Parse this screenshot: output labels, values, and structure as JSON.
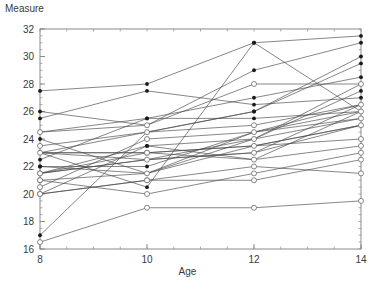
{
  "chart_data": {
    "type": "line",
    "title": "",
    "xlabel": "Age",
    "ylabel": "Measure",
    "xlim": [
      8,
      14
    ],
    "ylim": [
      16,
      32
    ],
    "x": [
      8,
      10,
      12,
      14
    ],
    "xticks": [
      8,
      10,
      12,
      14
    ],
    "xtick_labels": [
      "8",
      "10",
      "12",
      "14"
    ],
    "yticks": [
      16,
      18,
      20,
      22,
      24,
      26,
      28,
      30,
      32
    ],
    "ytick_labels": [
      "16",
      "18",
      "20",
      "22",
      "24",
      "26",
      "28",
      "30",
      "32"
    ],
    "x_minor_step": 0.5,
    "y_minor_step": 0.5,
    "grid": false,
    "legend": "none",
    "marker_styles": {
      "filled": "solid black dot",
      "open": "open circle"
    },
    "series": [
      {
        "name": "M01",
        "marker": "filled",
        "values": [
          26.0,
          25.0,
          29.0,
          31.0
        ]
      },
      {
        "name": "M02",
        "marker": "filled",
        "values": [
          21.5,
          22.5,
          23.0,
          26.5
        ]
      },
      {
        "name": "M03",
        "marker": "filled",
        "values": [
          23.0,
          22.5,
          24.0,
          27.5
        ]
      },
      {
        "name": "M04",
        "marker": "filled",
        "values": [
          25.5,
          27.5,
          26.5,
          27.0
        ]
      },
      {
        "name": "M05",
        "marker": "filled",
        "values": [
          20.0,
          23.5,
          22.5,
          26.0
        ]
      },
      {
        "name": "M06",
        "marker": "filled",
        "values": [
          24.5,
          25.5,
          27.0,
          28.5
        ]
      },
      {
        "name": "M07",
        "marker": "filled",
        "values": [
          22.0,
          22.0,
          24.5,
          26.5
        ]
      },
      {
        "name": "M08",
        "marker": "filled",
        "values": [
          24.0,
          21.5,
          24.5,
          25.5
        ]
      },
      {
        "name": "M09",
        "marker": "filled",
        "values": [
          23.0,
          20.5,
          31.0,
          26.0
        ]
      },
      {
        "name": "M10",
        "marker": "filled",
        "values": [
          27.5,
          28.0,
          31.0,
          31.5
        ]
      },
      {
        "name": "M11",
        "marker": "filled",
        "values": [
          23.0,
          23.0,
          23.5,
          25.0
        ]
      },
      {
        "name": "M12",
        "marker": "filled",
        "values": [
          21.5,
          23.5,
          24.0,
          28.0
        ]
      },
      {
        "name": "M13",
        "marker": "filled",
        "values": [
          17.0,
          24.5,
          26.0,
          29.5
        ]
      },
      {
        "name": "M14",
        "marker": "filled",
        "values": [
          22.5,
          25.5,
          25.5,
          26.0
        ]
      },
      {
        "name": "M15",
        "marker": "filled",
        "values": [
          23.0,
          24.5,
          26.0,
          30.0
        ]
      },
      {
        "name": "M16",
        "marker": "filled",
        "values": [
          22.0,
          21.5,
          23.5,
          25.0
        ]
      },
      {
        "name": "F01",
        "marker": "open",
        "values": [
          21.0,
          20.0,
          21.5,
          23.0
        ]
      },
      {
        "name": "F02",
        "marker": "open",
        "values": [
          21.0,
          21.5,
          24.0,
          25.5
        ]
      },
      {
        "name": "F03",
        "marker": "open",
        "values": [
          20.5,
          24.0,
          24.5,
          26.0
        ]
      },
      {
        "name": "F04",
        "marker": "open",
        "values": [
          23.5,
          24.5,
          25.0,
          26.5
        ]
      },
      {
        "name": "F05",
        "marker": "open",
        "values": [
          21.5,
          23.0,
          22.5,
          23.5
        ]
      },
      {
        "name": "F06",
        "marker": "open",
        "values": [
          20.0,
          21.0,
          21.0,
          22.5
        ]
      },
      {
        "name": "F07",
        "marker": "open",
        "values": [
          21.5,
          22.5,
          23.0,
          25.0
        ]
      },
      {
        "name": "F08",
        "marker": "open",
        "values": [
          23.0,
          23.0,
          23.5,
          24.0
        ]
      },
      {
        "name": "F09",
        "marker": "open",
        "values": [
          20.0,
          21.0,
          22.0,
          21.5
        ]
      },
      {
        "name": "F10",
        "marker": "open",
        "values": [
          16.5,
          19.0,
          19.0,
          19.5
        ]
      },
      {
        "name": "F11",
        "marker": "open",
        "values": [
          24.5,
          25.0,
          28.0,
          28.0
        ]
      }
    ]
  },
  "colors": {
    "line": "#4a4a4a",
    "marker_fill": "#1a1a1a",
    "marker_open_stroke": "#6a6a6a",
    "axis": "#8a8a8a",
    "text": "#3a3a3a",
    "background": "#ffffff"
  }
}
